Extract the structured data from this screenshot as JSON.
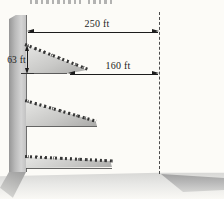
{
  "figure": {
    "description_labels": {
      "total_distance": "250 ft",
      "middle_distance": "160 ft",
      "ledge_height": "63 ft"
    },
    "colors": {
      "dimension_line": "#1c1c1c",
      "wall_gray_dark": "#969696",
      "wall_gray_light": "#d4d4d4",
      "ledge_light": "#e6e6e4",
      "ledge_dark": "#a9a9a7",
      "dashed_reference_line": "#4c4c4c",
      "ground_light": "#d7d7d5",
      "shadow_gray": "#9e9e9e",
      "background": "#fcfbf7"
    }
  }
}
